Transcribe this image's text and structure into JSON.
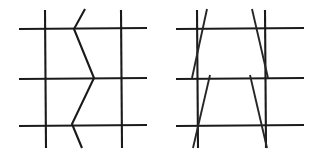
{
  "figure": {
    "background_color": "#ffffff",
    "stroke_color": "#1a1a1a",
    "stroke_width": 2.1,
    "canvas": {
      "width": 313,
      "height": 156
    },
    "panels": [
      {
        "id": "left-panel",
        "name": "grid-with-zigzag",
        "label": "Left figure: grid of three vertical and three horizontal lines with a zigzag chevron through the middle",
        "grid": {
          "verticals": [
            {
              "name": "vertical-left",
              "x": 45,
              "y1": 10,
              "y2": 148
            },
            {
              "name": "vertical-middle",
              "x": 47,
              "y1": 10,
              "y2": 148
            },
            {
              "name": "vertical-right",
              "x": 121,
              "y1": 10,
              "y2": 148
            }
          ],
          "horizontals": [
            {
              "name": "horizontal-top",
              "y": 28,
              "x1": 19,
              "x2": 147
            },
            {
              "name": "horizontal-middle",
              "y": 78,
              "x1": 19,
              "x2": 147
            },
            {
              "name": "horizontal-bottom",
              "y": 125,
              "x1": 19,
              "x2": 147
            }
          ]
        },
        "zigzag": {
          "name": "zigzag-chevron",
          "points": [
            {
              "x": 85,
              "y": 9
            },
            {
              "x": 74,
              "y": 29
            },
            {
              "x": 94,
              "y": 78
            },
            {
              "x": 72,
              "y": 124
            },
            {
              "x": 82,
              "y": 148
            }
          ]
        }
      },
      {
        "id": "right-panel",
        "name": "grid-with-trapezoids",
        "label": "Right figure: grid of three vertical and three horizontal lines with two stacked trapezoid outlines",
        "grid": {
          "verticals": [
            {
              "name": "vertical-left",
              "x": 197,
              "y1": 10,
              "y2": 148
            },
            {
              "name": "vertical-right",
              "x": 265,
              "y1": 10,
              "y2": 148
            }
          ],
          "horizontals": [
            {
              "name": "horizontal-top",
              "y": 28,
              "x1": 176,
              "x2": 304
            },
            {
              "name": "horizontal-middle",
              "y": 78,
              "x1": 176,
              "x2": 304
            },
            {
              "name": "horizontal-bottom",
              "y": 125,
              "x1": 176,
              "x2": 304
            }
          ]
        },
        "slants": [
          {
            "name": "upper-trapezoid-left-slant",
            "x1": 207,
            "y1": 9,
            "x2": 192,
            "y2": 78
          },
          {
            "name": "upper-trapezoid-right-slant",
            "x1": 252,
            "y1": 9,
            "x2": 268,
            "y2": 78
          },
          {
            "name": "lower-trapezoid-left-slant",
            "x1": 210,
            "y1": 75,
            "x2": 193,
            "y2": 148
          },
          {
            "name": "lower-trapezoid-right-slant",
            "x1": 250,
            "y1": 75,
            "x2": 267,
            "y2": 148
          }
        ]
      }
    ]
  }
}
